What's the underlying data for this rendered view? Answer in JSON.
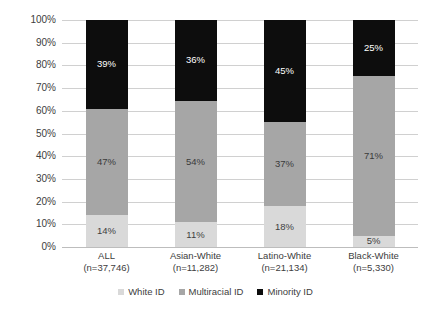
{
  "chart_data": {
    "type": "bar",
    "subtype": "stacked-bar-100",
    "title": "",
    "xlabel": "",
    "ylabel": "",
    "ylim": [
      0,
      100
    ],
    "grid": true,
    "legend_position": "bottom",
    "categories": [
      "ALL",
      "Asian-White",
      "Latino-White",
      "Black-White"
    ],
    "category_sublabels": [
      "(n=37,746)",
      "(n=11,282)",
      "(n=21,134)",
      "(n=5,330)"
    ],
    "ytick_labels": [
      "0%",
      "10%",
      "20%",
      "30%",
      "40%",
      "50%",
      "60%",
      "70%",
      "80%",
      "90%",
      "100%"
    ],
    "ytick_values": [
      0,
      10,
      20,
      30,
      40,
      50,
      60,
      70,
      80,
      90,
      100
    ],
    "series": [
      {
        "name": "White ID",
        "color": "#d9d9d9",
        "values": [
          14,
          11,
          18,
          5
        ],
        "labels": [
          "14%",
          "11%",
          "18%",
          "5%"
        ]
      },
      {
        "name": "Multiracial ID",
        "color": "#a6a6a6",
        "values": [
          47,
          54,
          37,
          71
        ],
        "labels": [
          "47%",
          "54%",
          "37%",
          "71%"
        ]
      },
      {
        "name": "Minority ID",
        "color": "#0d0d0d",
        "values": [
          39,
          36,
          45,
          25
        ],
        "labels": [
          "39%",
          "36%",
          "45%",
          "25%"
        ]
      }
    ]
  }
}
